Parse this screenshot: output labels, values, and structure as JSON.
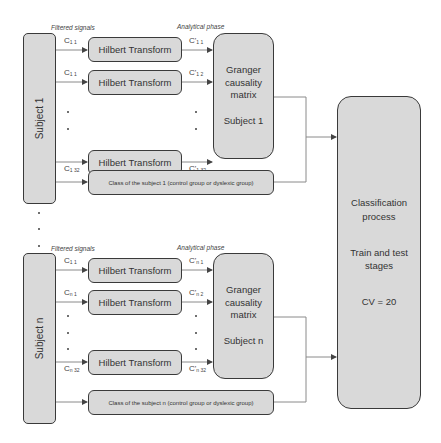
{
  "headers": {
    "filtered_signals": "Filtered signals",
    "analytical_phase": "Analytical phase"
  },
  "subject1": {
    "label": "Subject 1",
    "inputs": [
      {
        "base": "C",
        "sub": "1 1"
      },
      {
        "base": "C",
        "sub": "1 1"
      },
      {
        "base": "C",
        "sub": "1 32"
      }
    ],
    "outputs": [
      {
        "base": "C'",
        "sub": "1 1"
      },
      {
        "base": "C'",
        "sub": "1 2"
      },
      {
        "base": "C'",
        "sub": "1 32"
      }
    ],
    "hilbert_label": "Hilbert Transform",
    "granger": {
      "line1": "Granger",
      "line2": "causality",
      "line3": "matrix",
      "subject": "Subject 1"
    },
    "class_label": "Class of the subject 1 (control group or dyslexic group)"
  },
  "subjectn": {
    "label": "Subject n",
    "inputs": [
      {
        "base": "C",
        "sub": "1 1"
      },
      {
        "base": "C",
        "sub": "n 1"
      },
      {
        "base": "C",
        "sub": "n 32"
      }
    ],
    "outputs": [
      {
        "base": "C'",
        "sub": "n 1"
      },
      {
        "base": "C'",
        "sub": "n 2"
      },
      {
        "base": "C'",
        "sub": "n 32"
      }
    ],
    "hilbert_label": "Hilbert Transform",
    "granger": {
      "line1": "Granger",
      "line2": "causality",
      "line3": "matrix",
      "subject": "Subject n"
    },
    "class_label": "Class of the subject n (control group or dyslexic group)"
  },
  "classification": {
    "line1": "Classification",
    "line2": "process",
    "line3": "Train and test",
    "line4": "stages",
    "line5": "CV = 20"
  },
  "colors": {
    "box_fill": "#d9d9d9",
    "box_border": "#3a3a3a",
    "connector": "#8a8a8a",
    "arrow": "#444444"
  }
}
